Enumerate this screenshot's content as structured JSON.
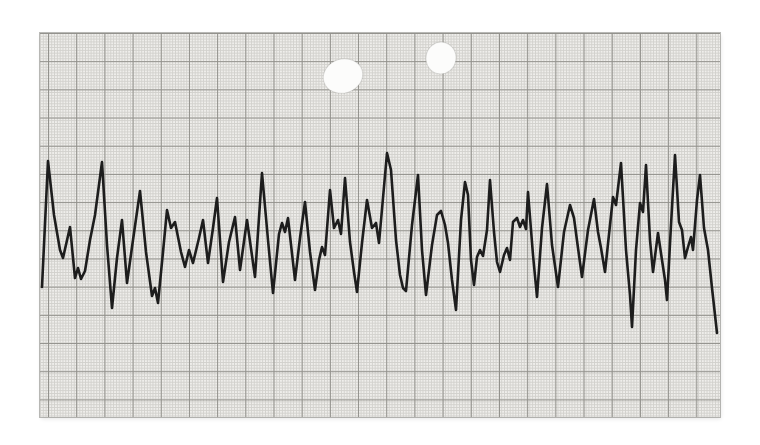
{
  "colors": {
    "page_background": "#ffffff",
    "paper_background": "#efeeeb",
    "grid_minor": "#d2d1cd",
    "grid_major": "#92918c",
    "trace": "#1d1d1d",
    "hole_fill": "#fcfcfb"
  },
  "paper": {
    "x": 40,
    "y": 33,
    "width": 680,
    "height": 384,
    "grid_major_spacing_px": 28.2,
    "grid_minor_spacing_px": 2.82,
    "punch_holes": [
      {
        "cx": 343,
        "cy": 76,
        "rx": 20,
        "ry": 17,
        "rotate": -18
      },
      {
        "cx": 441,
        "cy": 58,
        "rx": 15,
        "ry": 16,
        "rotate": 8
      }
    ]
  },
  "chart_data": {
    "type": "line",
    "title": "",
    "xlabel": "",
    "ylabel": "",
    "axis_ticks_visible": false,
    "legend": null,
    "grid": "fine squared recording paper, heavy rule every 10 minor squares",
    "x_range_px": [
      42,
      717
    ],
    "baseline_y_px": 240,
    "series": [
      {
        "name": "strip-chart-trace",
        "stroke_width_px": 2.6,
        "points_px": [
          [
            42,
            287
          ],
          [
            48,
            161
          ],
          [
            54,
            215
          ],
          [
            60,
            250
          ],
          [
            63,
            258
          ],
          [
            70,
            227
          ],
          [
            75,
            278
          ],
          [
            78,
            268
          ],
          [
            81,
            279
          ],
          [
            85,
            271
          ],
          [
            90,
            240
          ],
          [
            95,
            215
          ],
          [
            102,
            162
          ],
          [
            107,
            245
          ],
          [
            112,
            308
          ],
          [
            117,
            258
          ],
          [
            122,
            220
          ],
          [
            127,
            283
          ],
          [
            133,
            240
          ],
          [
            140,
            191
          ],
          [
            146,
            252
          ],
          [
            152,
            296
          ],
          [
            155,
            288
          ],
          [
            158,
            303
          ],
          [
            163,
            252
          ],
          [
            167,
            210
          ],
          [
            171,
            228
          ],
          [
            175,
            222
          ],
          [
            181,
            252
          ],
          [
            185,
            267
          ],
          [
            189,
            250
          ],
          [
            193,
            263
          ],
          [
            199,
            238
          ],
          [
            203,
            220
          ],
          [
            208,
            263
          ],
          [
            213,
            228
          ],
          [
            217,
            198
          ],
          [
            223,
            282
          ],
          [
            229,
            242
          ],
          [
            235,
            217
          ],
          [
            240,
            270
          ],
          [
            247,
            220
          ],
          [
            255,
            277
          ],
          [
            262,
            173
          ],
          [
            268,
            240
          ],
          [
            273,
            293
          ],
          [
            279,
            234
          ],
          [
            282,
            223
          ],
          [
            285,
            232
          ],
          [
            288,
            218
          ],
          [
            295,
            280
          ],
          [
            300,
            238
          ],
          [
            305,
            202
          ],
          [
            310,
            252
          ],
          [
            315,
            290
          ],
          [
            319,
            260
          ],
          [
            322,
            247
          ],
          [
            325,
            255
          ],
          [
            330,
            190
          ],
          [
            334,
            228
          ],
          [
            338,
            220
          ],
          [
            341,
            234
          ],
          [
            345,
            178
          ],
          [
            350,
            242
          ],
          [
            354,
            272
          ],
          [
            357,
            292
          ],
          [
            362,
            243
          ],
          [
            367,
            200
          ],
          [
            372,
            228
          ],
          [
            376,
            223
          ],
          [
            379,
            243
          ],
          [
            383,
            198
          ],
          [
            387,
            153
          ],
          [
            391,
            170
          ],
          [
            396,
            240
          ],
          [
            400,
            275
          ],
          [
            403,
            288
          ],
          [
            406,
            291
          ],
          [
            412,
            225
          ],
          [
            418,
            175
          ],
          [
            422,
            250
          ],
          [
            426,
            295
          ],
          [
            432,
            245
          ],
          [
            437,
            215
          ],
          [
            441,
            211
          ],
          [
            445,
            225
          ],
          [
            448,
            243
          ],
          [
            452,
            280
          ],
          [
            456,
            310
          ],
          [
            461,
            220
          ],
          [
            465,
            182
          ],
          [
            468,
            195
          ],
          [
            471,
            260
          ],
          [
            474,
            285
          ],
          [
            477,
            257
          ],
          [
            480,
            250
          ],
          [
            483,
            256
          ],
          [
            487,
            230
          ],
          [
            490,
            180
          ],
          [
            494,
            232
          ],
          [
            497,
            262
          ],
          [
            500,
            272
          ],
          [
            504,
            255
          ],
          [
            507,
            248
          ],
          [
            510,
            260
          ],
          [
            513,
            222
          ],
          [
            517,
            218
          ],
          [
            520,
            227
          ],
          [
            523,
            220
          ],
          [
            526,
            229
          ],
          [
            528,
            192
          ],
          [
            533,
            255
          ],
          [
            537,
            297
          ],
          [
            542,
            228
          ],
          [
            547,
            184
          ],
          [
            552,
            245
          ],
          [
            558,
            287
          ],
          [
            564,
            232
          ],
          [
            570,
            205
          ],
          [
            574,
            218
          ],
          [
            578,
            248
          ],
          [
            582,
            277
          ],
          [
            588,
            230
          ],
          [
            594,
            199
          ],
          [
            598,
            232
          ],
          [
            601,
            248
          ],
          [
            605,
            272
          ],
          [
            610,
            225
          ],
          [
            613,
            197
          ],
          [
            616,
            205
          ],
          [
            621,
            163
          ],
          [
            626,
            250
          ],
          [
            630,
            295
          ],
          [
            632,
            327
          ],
          [
            636,
            250
          ],
          [
            640,
            203
          ],
          [
            643,
            212
          ],
          [
            646,
            165
          ],
          [
            650,
            240
          ],
          [
            653,
            272
          ],
          [
            658,
            233
          ],
          [
            662,
            260
          ],
          [
            665,
            280
          ],
          [
            667,
            300
          ],
          [
            671,
            225
          ],
          [
            675,
            155
          ],
          [
            679,
            222
          ],
          [
            682,
            230
          ],
          [
            685,
            258
          ],
          [
            688,
            247
          ],
          [
            691,
            237
          ],
          [
            693,
            250
          ],
          [
            697,
            200
          ],
          [
            700,
            175
          ],
          [
            704,
            228
          ],
          [
            708,
            250
          ],
          [
            712,
            288
          ],
          [
            717,
            333
          ]
        ]
      }
    ]
  }
}
